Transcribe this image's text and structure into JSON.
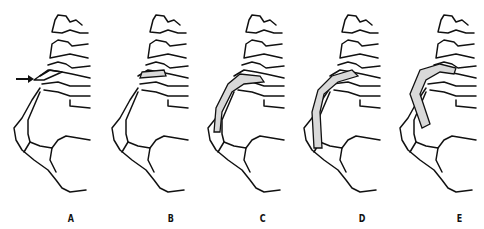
{
  "figure": {
    "panels": [
      {
        "label": "A",
        "graft": "none",
        "arrow": true
      },
      {
        "label": "B",
        "graft": "short-disc"
      },
      {
        "label": "C",
        "graft": "medium-strut"
      },
      {
        "label": "D",
        "graft": "long-strut"
      },
      {
        "label": "E",
        "graft": "long-strut-angled"
      }
    ],
    "colors": {
      "line": "#111111",
      "graft_fill": "#d9d9d9",
      "background": "#ffffff"
    }
  }
}
